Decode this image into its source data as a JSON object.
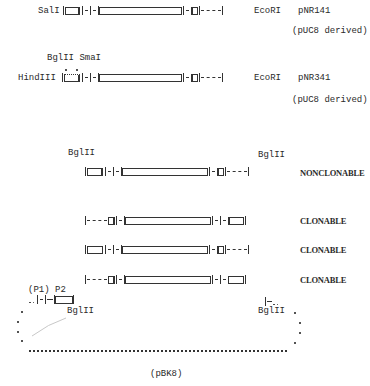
{
  "constructs": [
    {
      "name": "pNR141",
      "left_site": "SalI",
      "right_site": "EcoRI",
      "origin_note": "(pUC8 derived)"
    },
    {
      "name": "pNR341",
      "left_site": "HindIII",
      "right_site": "EcoRI",
      "upper_sites": "BglII SmaI",
      "origin_note": "(pUC8 derived)"
    }
  ],
  "fragment_section": {
    "left_site": "BglII",
    "right_site": "BglII",
    "rows": [
      {
        "orientation": "forward",
        "status": "NONCLONABLE"
      },
      {
        "orientation": "reverse",
        "status": "CLONABLE"
      },
      {
        "orientation": "forward",
        "status": "CLONABLE"
      },
      {
        "orientation": "reverse",
        "status": "CLONABLE"
      }
    ]
  },
  "vector": {
    "promoters": "(P1) P2",
    "left_site": "BglII",
    "right_site": "BglII",
    "name": "(pBK8)"
  }
}
